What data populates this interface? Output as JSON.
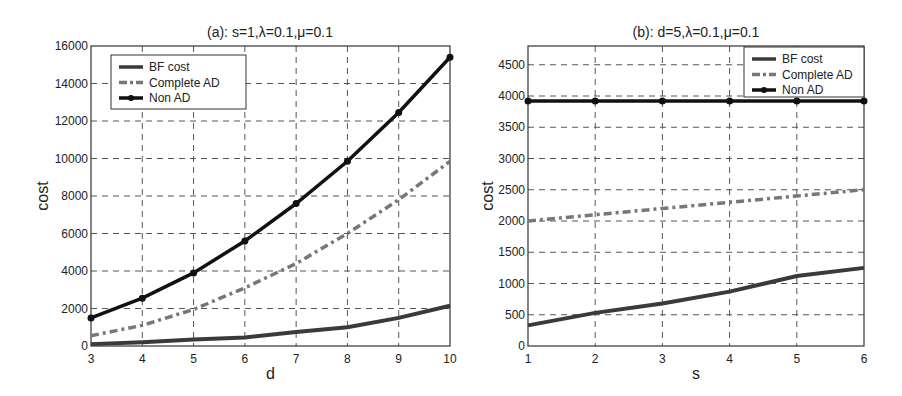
{
  "chart_data": [
    {
      "type": "line",
      "title": "(a): s=1,λ=0.1,μ=0.1",
      "xlabel": "d",
      "ylabel": "cost",
      "x": [
        3,
        4,
        5,
        6,
        7,
        8,
        9,
        10
      ],
      "xlim": [
        3,
        10
      ],
      "ylim": [
        0,
        16000
      ],
      "xticks": [
        3,
        4,
        5,
        6,
        7,
        8,
        9,
        10
      ],
      "yticks": [
        0,
        2000,
        4000,
        6000,
        8000,
        10000,
        12000,
        14000,
        16000
      ],
      "grid": true,
      "legend_position": "upper left",
      "series": [
        {
          "name": "BF cost",
          "style": "solid",
          "color": "#3a3a3a",
          "marker": "none",
          "values": [
            100,
            200,
            350,
            450,
            750,
            1000,
            1500,
            2150
          ]
        },
        {
          "name": "Complete AD",
          "style": "dash-dot",
          "color": "#777777",
          "marker": "none",
          "values": [
            550,
            1100,
            1950,
            3100,
            4400,
            6000,
            7800,
            9850
          ]
        },
        {
          "name": "Non AD",
          "style": "solid",
          "color": "#111111",
          "marker": "dot",
          "values": [
            1500,
            2550,
            3900,
            5600,
            7600,
            9850,
            12450,
            15400
          ]
        }
      ]
    },
    {
      "type": "line",
      "title": "(b): d=5,λ=0.1,μ=0.1",
      "xlabel": "s",
      "ylabel": "cost",
      "x": [
        1,
        2,
        3,
        4,
        5,
        6
      ],
      "xlim": [
        1,
        6
      ],
      "ylim": [
        0,
        4800
      ],
      "xticks": [
        1,
        2,
        3,
        4,
        5,
        6
      ],
      "yticks": [
        0,
        500,
        1000,
        1500,
        2000,
        2500,
        3000,
        3500,
        4000,
        4500
      ],
      "grid": true,
      "legend_position": "upper right",
      "series": [
        {
          "name": "BF cost",
          "style": "solid",
          "color": "#3a3a3a",
          "marker": "none",
          "values": [
            330,
            530,
            680,
            870,
            1120,
            1250
          ]
        },
        {
          "name": "Complete AD",
          "style": "dash-dot",
          "color": "#777777",
          "marker": "none",
          "values": [
            2000,
            2100,
            2200,
            2300,
            2400,
            2500
          ]
        },
        {
          "name": "Non AD",
          "style": "solid",
          "color": "#111111",
          "marker": "dot",
          "values": [
            3920,
            3920,
            3920,
            3920,
            3920,
            3920
          ]
        }
      ]
    }
  ]
}
